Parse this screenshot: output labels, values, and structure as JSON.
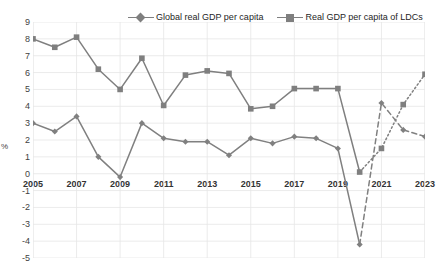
{
  "chart_data": {
    "type": "line",
    "title": "",
    "subtitle": "",
    "xlabel": "",
    "ylabel": "%",
    "xlim": [
      2005,
      2023
    ],
    "ylim": [
      -5,
      9
    ],
    "ytick_labels": [
      "9",
      "8",
      "7",
      "6",
      "5",
      "4",
      "3",
      "2",
      "1",
      "0",
      "-1",
      "-2",
      "-3",
      "-4",
      "-5"
    ],
    "ytick_values": [
      9,
      8,
      7,
      6,
      5,
      4,
      3,
      2,
      1,
      0,
      -1,
      -2,
      -3,
      -4,
      -5
    ],
    "xtick_labels": [
      "2005",
      "2007",
      "2009",
      "2011",
      "2013",
      "2015",
      "2017",
      "2019",
      "2021",
      "2023"
    ],
    "xtick_values": [
      2005,
      2007,
      2009,
      2011,
      2013,
      2015,
      2017,
      2019,
      2021,
      2023
    ],
    "x": [
      2005,
      2006,
      2007,
      2008,
      2009,
      2010,
      2011,
      2012,
      2013,
      2014,
      2015,
      2016,
      2017,
      2018,
      2019,
      2020,
      2021,
      2022,
      2023
    ],
    "grid": true,
    "grid_color": "#e6e6e6",
    "legend_position": "top-center",
    "projection_start_year": 2020,
    "series": [
      {
        "name": "Global real GDP per capita",
        "marker": "diamond",
        "color": "#808080",
        "line_style_actual": "solid",
        "line_style_projection": "dashed",
        "values": [
          3.0,
          2.5,
          3.4,
          1.0,
          -0.2,
          3.0,
          2.1,
          1.9,
          1.9,
          1.1,
          2.1,
          1.8,
          2.2,
          2.1,
          1.5,
          -4.2,
          4.2,
          2.6,
          2.2
        ]
      },
      {
        "name": "Real GDP per capita of LDCs",
        "marker": "square",
        "color": "#7f7f7f",
        "line_style_actual": "solid",
        "line_style_projection": "dotted",
        "values": [
          8.0,
          7.5,
          8.1,
          6.2,
          5.0,
          6.85,
          4.05,
          5.85,
          6.1,
          5.95,
          3.85,
          4.0,
          5.05,
          5.05,
          5.05,
          0.1,
          1.5,
          4.1,
          5.9
        ]
      }
    ]
  },
  "legend": {
    "items": [
      {
        "label": "Global real GDP per capita",
        "marker": "diamond-marker-icon"
      },
      {
        "label": "Real GDP per capita of LDCs",
        "marker": "square-marker-icon"
      }
    ]
  },
  "axes": {
    "y_title": "%"
  },
  "colors": {
    "series_gray": "#808080",
    "grid": "#e6e6e6",
    "text": "#3f3f3f",
    "background": "#ffffff"
  }
}
